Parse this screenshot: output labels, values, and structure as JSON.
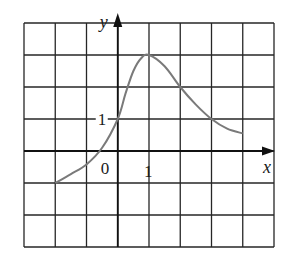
{
  "chart_data": {
    "type": "line",
    "title": "",
    "xlabel": "x",
    "ylabel": "y",
    "xlim": [
      -3,
      5
    ],
    "ylim": [
      -3,
      4
    ],
    "grid": true,
    "grid_step": 1,
    "tick_labels": {
      "origin": "0",
      "x": [
        {
          "value": 1,
          "label": "1"
        }
      ],
      "y": [
        {
          "value": 1,
          "label": "1"
        }
      ]
    },
    "series": [
      {
        "name": "f(x)",
        "color": "#7a7a7a",
        "x": [
          -2,
          -1.5,
          -1,
          -0.5,
          0,
          0.25,
          0.5,
          0.75,
          1,
          1.5,
          2,
          2.5,
          3,
          3.5,
          4
        ],
        "y": [
          -1,
          -0.72,
          -0.42,
          0.1,
          1,
          1.8,
          2.5,
          2.9,
          3,
          2.65,
          2.0,
          1.45,
          1.0,
          0.7,
          0.55
        ]
      }
    ],
    "colors": {
      "grid": "#262626",
      "axes": "#111111",
      "curve": "#7a7a7a"
    }
  }
}
